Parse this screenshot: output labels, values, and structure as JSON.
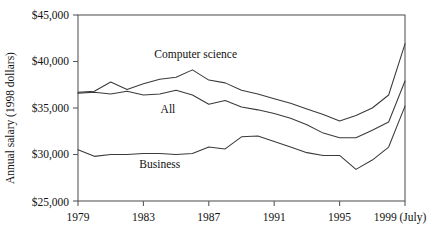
{
  "chart_data": {
    "type": "line",
    "title": "",
    "xlabel": "",
    "ylabel": "Annual salary (1998 dollars)",
    "xlim": [
      1979,
      1999
    ],
    "ylim": [
      25000,
      45000
    ],
    "grid": false,
    "legend_position": "inline-annotations",
    "x": [
      1979,
      1980,
      1981,
      1982,
      1983,
      1984,
      1985,
      1986,
      1987,
      1988,
      1989,
      1990,
      1991,
      1992,
      1993,
      1994,
      1995,
      1996,
      1997,
      1998,
      1999
    ],
    "x_tick_labels": [
      "1979",
      "1983",
      "1987",
      "1991",
      "1995",
      "1999 (July)"
    ],
    "x_tick_values": [
      1979,
      1983,
      1987,
      1991,
      1995,
      1999
    ],
    "y_tick_labels": [
      "$45,000",
      "$40,000",
      "$35,000",
      "$30,000",
      "$25,000"
    ],
    "y_tick_values": [
      45000,
      40000,
      35000,
      30000,
      25000
    ],
    "series": [
      {
        "name": "Computer science",
        "label_x": 1986.2,
        "label_y": 40350,
        "values": [
          36700,
          36800,
          37800,
          37000,
          37600,
          38100,
          38300,
          39100,
          38000,
          37700,
          36900,
          36500,
          36000,
          35500,
          34900,
          34300,
          33600,
          34200,
          35000,
          36400,
          41900
        ]
      },
      {
        "name": "All",
        "label_x": 1984.5,
        "label_y": 34450,
        "values": [
          36600,
          36700,
          36500,
          36800,
          36400,
          36500,
          36900,
          36400,
          35400,
          35800,
          35100,
          34800,
          34400,
          33900,
          33200,
          32300,
          31800,
          31800,
          32600,
          33500,
          37900
        ]
      },
      {
        "name": "Business",
        "label_x": 1984.0,
        "label_y": 28550,
        "values": [
          30500,
          29800,
          30000,
          30000,
          30100,
          30100,
          30000,
          30100,
          30800,
          30600,
          31900,
          32000,
          31400,
          30800,
          30200,
          29900,
          29900,
          28400,
          29400,
          30800,
          35200
        ]
      }
    ]
  },
  "axis": {
    "y_title": "Annual salary (1998 dollars)"
  }
}
